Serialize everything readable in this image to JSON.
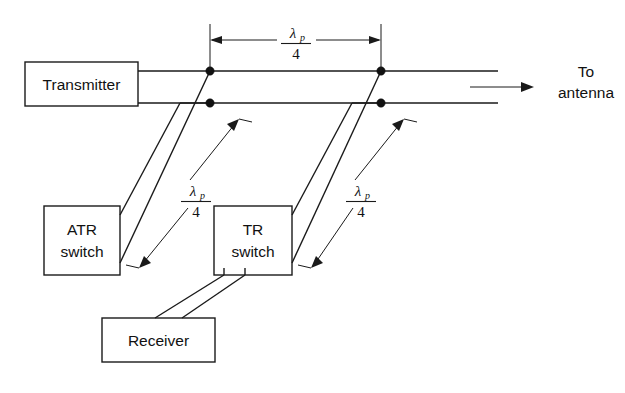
{
  "figure": {
    "kind": "waveguide-duplexer-schematic",
    "background_color": "#ffffff",
    "line_color": "#1a1a1a"
  },
  "boxes": {
    "transmitter": {
      "label": "Transmitter",
      "x": 25,
      "y": 62,
      "w": 113,
      "h": 44
    },
    "atr_switch": {
      "label_line1": "ATR",
      "label_line2": "switch",
      "x": 44,
      "y": 206,
      "w": 76,
      "h": 69
    },
    "tr_switch": {
      "label_line1": "TR",
      "label_line2": "switch",
      "x": 214,
      "y": 206,
      "w": 78,
      "h": 69
    },
    "receiver": {
      "label": "Receiver",
      "x": 102,
      "y": 318,
      "w": 113,
      "h": 44
    }
  },
  "annotations": {
    "to_antenna_line1": "To",
    "to_antenna_line2": "antenna",
    "lambda_symbol": "λ",
    "lambda_subscript": "p",
    "fraction_denominator": "4",
    "dimension_top": "λ_p / 4",
    "dimension_left": "λ_p / 4",
    "dimension_right": "λ_p / 4"
  },
  "labels": {
    "top_dimension": {
      "x": 296,
      "y": 22
    },
    "left_dimension": {
      "x": 196,
      "y": 196
    },
    "right_dimension": {
      "x": 361,
      "y": 196
    }
  },
  "nodes": [
    {
      "name": "junction-upper-left",
      "x": 210,
      "y": 71
    },
    {
      "name": "junction-lower-left",
      "x": 210,
      "y": 103
    },
    {
      "name": "junction-upper-right",
      "x": 381,
      "y": 71
    },
    {
      "name": "junction-lower-right",
      "x": 381,
      "y": 103
    }
  ]
}
